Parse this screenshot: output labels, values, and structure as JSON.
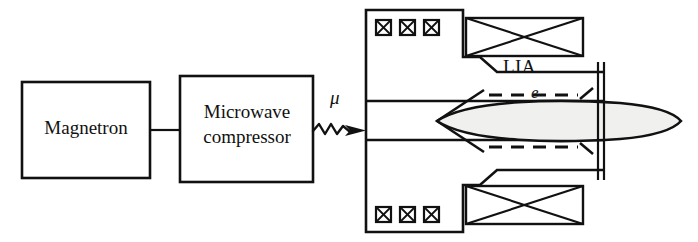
{
  "figure": {
    "background_color": "#ffffff",
    "line_color": "#111111",
    "lens_fill_color": "#f0f0ee"
  },
  "blocks": [
    {
      "id": "magnetron",
      "label": "Magnetron",
      "x": 22,
      "y": 82,
      "width": 128,
      "height": 96
    },
    {
      "id": "microwave-compressor",
      "label_line1": "Microwave",
      "label_line2": "compressor",
      "label": "Microwave compressor",
      "x": 180,
      "y": 76,
      "width": 133,
      "height": 106
    }
  ],
  "connector": {
    "name": "magnetron-to-compressor-link",
    "from_x": 150,
    "to_x": 180,
    "y": 130
  },
  "microwave": {
    "symbol": "μ",
    "symbol_name": "mu",
    "description": "microwave power injected into waveguide",
    "arrow_direction": "right"
  },
  "accelerator": {
    "label": "LIA",
    "full_name": "linear induction accelerator"
  },
  "beam": {
    "symbol": "e",
    "symbol_name": "electron-beam",
    "style": "dashed"
  },
  "magnet_coils": {
    "small_coil_count_top": 3,
    "small_coil_count_bottom": 3,
    "small_coil_size": 15,
    "top_small_coils_x": [
      376,
      400,
      424
    ],
    "top_small_coils_y": 20,
    "bottom_small_coils_x": [
      376,
      400,
      424
    ],
    "bottom_small_coils_y": 207,
    "large_coil_top": {
      "x": 466,
      "y": 18,
      "width": 117,
      "height": 38
    },
    "large_coil_bottom": {
      "x": 466,
      "y": 186,
      "width": 117,
      "height": 38
    },
    "glyph": "crossed-rectangle"
  },
  "waveguide": {
    "top_wall_y": 101,
    "bottom_wall_y": 140,
    "left_x": 366,
    "right_x": 604
  },
  "plasma_lens": {
    "name": "plasma-lens",
    "left_tip_x": 437,
    "right_tip_x": 681,
    "center_y": 121,
    "half_height": 22
  },
  "window": {
    "name": "output-window-foil",
    "x": 598,
    "width": 6,
    "top_y": 62,
    "bottom_y": 180
  }
}
